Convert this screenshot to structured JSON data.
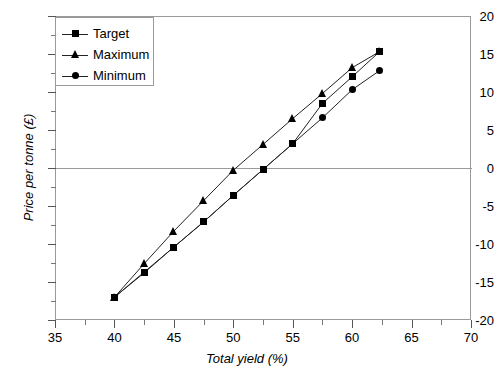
{
  "chart_data": {
    "type": "line",
    "title": "",
    "xlabel": "Total yield (%)",
    "ylabel": "Price per tonne (£)",
    "xlim": [
      35,
      70
    ],
    "ylim": [
      -20,
      20
    ],
    "xticks": [
      35,
      40,
      45,
      50,
      55,
      60,
      65,
      70
    ],
    "yticks": [
      -20,
      -15,
      -10,
      -5,
      0,
      5,
      10,
      15,
      20
    ],
    "xtick_labels": [
      "35",
      "40",
      "45",
      "50",
      "55",
      "60",
      "65",
      "70"
    ],
    "ytick_labels": [
      "-20",
      "-15",
      "-10",
      "-5",
      "0",
      "5",
      "10",
      "15",
      "20"
    ],
    "minor_tick_step": 2.5,
    "grid": false,
    "zero_line": true,
    "legend_position": "upper-left",
    "series": [
      {
        "name": "Target",
        "marker": "square",
        "x": [
          40,
          42.5,
          45,
          47.5,
          50,
          52.5,
          55,
          57.5,
          60,
          62.3
        ],
        "values": [
          -17.0,
          -13.7,
          -10.4,
          -7.1,
          -3.6,
          -0.2,
          3.2,
          8.5,
          12.0,
          15.3
        ]
      },
      {
        "name": "Maximum",
        "marker": "triangle",
        "x": [
          40,
          42.5,
          45,
          47.5,
          50,
          52.5,
          55,
          57.5,
          60,
          62.3
        ],
        "values": [
          -17.0,
          -12.6,
          -8.3,
          -4.3,
          -0.3,
          3.1,
          6.5,
          9.8,
          13.2,
          15.3
        ]
      },
      {
        "name": "Minimum",
        "marker": "circle",
        "x": [
          40,
          42.5,
          45,
          47.5,
          50,
          52.5,
          55,
          57.5,
          60,
          62.3
        ],
        "values": [
          -17.0,
          -13.8,
          -10.4,
          -7.1,
          -3.6,
          -0.2,
          3.2,
          6.6,
          10.3,
          12.8
        ]
      }
    ],
    "legend_entries": [
      "Target",
      "Maximum",
      "Minimum"
    ]
  },
  "style": {
    "line_color": "#222222",
    "marker_color": "#000000",
    "frame_color": "#9a9a9a",
    "text_color": "#000000",
    "background": "#ffffff"
  }
}
